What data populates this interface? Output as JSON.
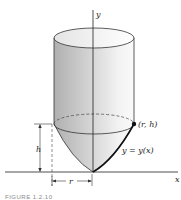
{
  "figure": {
    "axes": {
      "y_label": "y",
      "x_label": "x"
    },
    "labels": {
      "point": "(r, h)",
      "curve": "y = y(x)",
      "height": "h",
      "radius": "r"
    },
    "caption": "FIGURE 1.2.10"
  },
  "colors": {
    "shade_dark": "#a8a8a8",
    "shade_light": "#efefef",
    "line": "#222222"
  }
}
